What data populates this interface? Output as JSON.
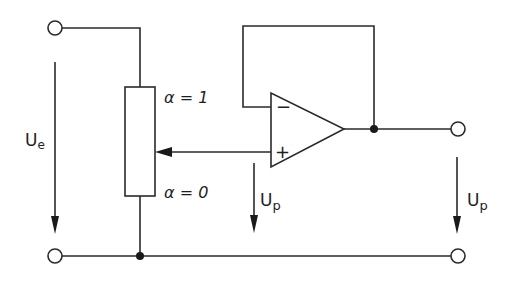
{
  "diagram": {
    "type": "circuit-schematic",
    "title": "",
    "labels": {
      "input_voltage": "U",
      "input_voltage_sub": "e",
      "pot_top": "α = 1",
      "pot_bottom": "α = 0",
      "opamp_minus": "−",
      "opamp_plus": "+",
      "wiper_voltage": "U",
      "wiper_voltage_sub": "p",
      "output_voltage": "U",
      "output_voltage_sub": "p"
    },
    "components": [
      {
        "id": "input-terminal-top",
        "type": "terminal",
        "x": 55,
        "y": 28
      },
      {
        "id": "input-terminal-bottom",
        "type": "terminal",
        "x": 55,
        "y": 256
      },
      {
        "id": "potentiometer",
        "type": "resistor-with-wiper",
        "x": 125,
        "y": 87,
        "w": 30,
        "h": 109,
        "wiper_y": 152
      },
      {
        "id": "opamp",
        "type": "op-amp",
        "left_x": 271,
        "top_y": 93,
        "bottom_y": 167,
        "tip_x": 344,
        "tip_y": 129
      },
      {
        "id": "output-node",
        "type": "junction",
        "x": 374,
        "y": 129
      },
      {
        "id": "ground-node",
        "type": "junction",
        "x": 140,
        "y": 256
      },
      {
        "id": "output-terminal-top",
        "type": "terminal",
        "x": 458,
        "y": 129
      },
      {
        "id": "output-terminal-bottom",
        "type": "terminal",
        "x": 458,
        "y": 256
      }
    ],
    "colors": {
      "line": "#2a2a2a",
      "background": "#ffffff"
    }
  }
}
